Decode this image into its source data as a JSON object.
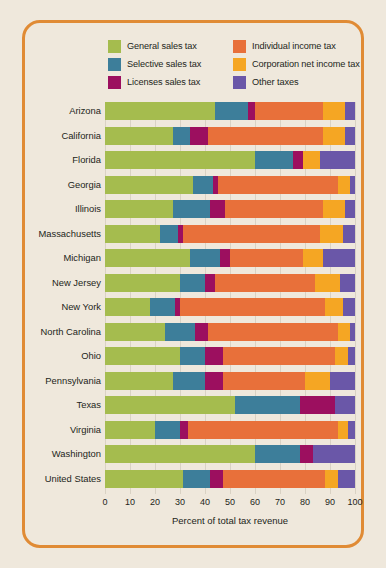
{
  "theme": {
    "background": "#EFE8DC",
    "frame_color": "#E08B35",
    "text_color": "#231F20",
    "grid_color": "#D9D2C4"
  },
  "legend": {
    "items": [
      {
        "label": "General sales tax",
        "color": "#A5BC4E",
        "key": "general_sales"
      },
      {
        "label": "Individual income tax",
        "color": "#E8703A",
        "key": "individual_income"
      },
      {
        "label": "Selective sales tax",
        "color": "#3D7E9A",
        "key": "selective_sales"
      },
      {
        "label": "Corporation net income tax",
        "color": "#F5A623",
        "key": "corporation_net_income"
      },
      {
        "label": "Licenses sales tax",
        "color": "#9C0F5F",
        "key": "licenses_sales"
      },
      {
        "label": "Other taxes",
        "color": "#6A57A8",
        "key": "other"
      }
    ]
  },
  "chart_data": {
    "type": "bar",
    "orientation": "horizontal",
    "stacked": true,
    "title": "",
    "xlabel": "Percent of total tax revenue",
    "ylabel": "",
    "xlim": [
      0,
      100
    ],
    "xticks": [
      0,
      10,
      20,
      30,
      40,
      50,
      60,
      70,
      80,
      90,
      100
    ],
    "grid": true,
    "legend_position": "top",
    "categories": [
      "Arizona",
      "California",
      "Florida",
      "Georgia",
      "Illinois",
      "Massachusetts",
      "Michigan",
      "New Jersey",
      "New York",
      "North Carolina",
      "Ohio",
      "Pennsylvania",
      "Texas",
      "Virginia",
      "Washington",
      "United States"
    ],
    "series": [
      {
        "name": "General sales tax",
        "color": "#A5BC4E",
        "values": [
          44,
          27,
          60,
          35,
          27,
          22,
          34,
          30,
          18,
          24,
          30,
          27,
          52,
          20,
          60,
          31
        ]
      },
      {
        "name": "Selective sales tax",
        "color": "#3D7E9A",
        "values": [
          13,
          7,
          15,
          8,
          15,
          7,
          12,
          10,
          10,
          12,
          10,
          13,
          26,
          10,
          18,
          11
        ]
      },
      {
        "name": "Licenses sales tax",
        "color": "#9C0F5F",
        "values": [
          3,
          7,
          4,
          2,
          6,
          2,
          4,
          4,
          2,
          5,
          7,
          7,
          14,
          3,
          5,
          5
        ]
      },
      {
        "name": "Individual income tax",
        "color": "#E8703A",
        "values": [
          27,
          46,
          0,
          48,
          39,
          55,
          29,
          40,
          58,
          52,
          45,
          33,
          0,
          60,
          0,
          41
        ]
      },
      {
        "name": "Corporation net income tax",
        "color": "#F5A623",
        "values": [
          9,
          9,
          7,
          5,
          9,
          9,
          8,
          10,
          7,
          5,
          5,
          10,
          0,
          4,
          0,
          5
        ]
      },
      {
        "name": "Other taxes",
        "color": "#6A57A8",
        "values": [
          4,
          4,
          14,
          2,
          4,
          5,
          13,
          6,
          5,
          2,
          3,
          10,
          8,
          3,
          17,
          7
        ]
      }
    ]
  }
}
